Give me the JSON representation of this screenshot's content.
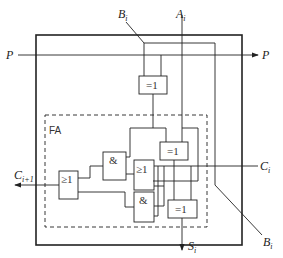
{
  "diagram": {
    "type": "logic-circuit",
    "block_label": "FA",
    "signals": {
      "p_in": "P",
      "p_out": "P",
      "b_top": {
        "main": "B",
        "sub": "i"
      },
      "a_top": {
        "main": "A",
        "sub": "i"
      },
      "c_in": {
        "main": "C",
        "sub": "i"
      },
      "c_out": {
        "main": "C",
        "sub": "i+1"
      },
      "s_out": {
        "main": "S",
        "sub": "i"
      },
      "b_out": {
        "main": "B",
        "sub": "i"
      }
    },
    "gates": {
      "xor_top": "=1",
      "xor_mid": "=1",
      "xor_bottom": "=1",
      "and_upper": "&",
      "and_lower": "&",
      "or_mid": "≥1",
      "or_left": "≥1"
    },
    "colors": {
      "line": "#222222",
      "background": "#ffffff"
    }
  }
}
